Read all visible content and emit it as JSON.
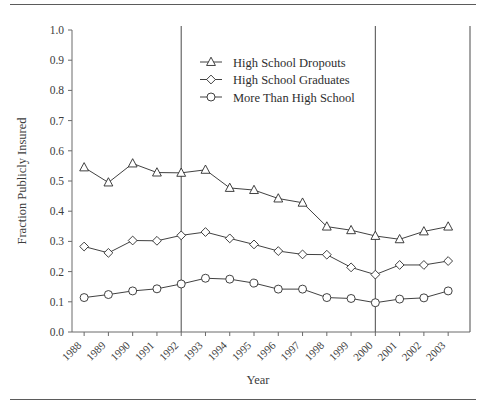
{
  "figure": {
    "has_top_rule": true,
    "has_bottom_rule": true,
    "background_color": "#ffffff",
    "ink_color": "#2b2b2b"
  },
  "chart_data": {
    "type": "line",
    "title": "",
    "xlabel": "Year",
    "ylabel": "Fraction Publicly Insured",
    "xlim": [
      1987.5,
      2003.9
    ],
    "ylim": [
      0.0,
      1.0
    ],
    "grid": false,
    "legend_position": "top-center",
    "categories": [
      "1988",
      "1989",
      "1990",
      "1991",
      "1992",
      "1993",
      "1994",
      "1995",
      "1996",
      "1997",
      "1998",
      "1999",
      "2000",
      "2001",
      "2002",
      "2003"
    ],
    "x": [
      1988,
      1989,
      1990,
      1991,
      1992,
      1993,
      1994,
      1995,
      1996,
      1997,
      1998,
      1999,
      2000,
      2001,
      2002,
      2003
    ],
    "ytick_labels": [
      "0.0",
      "0.1",
      "0.2",
      "0.3",
      "0.4",
      "0.5",
      "0.6",
      "0.7",
      "0.8",
      "0.9",
      "1.0"
    ],
    "ytick_values": [
      0.0,
      0.1,
      0.2,
      0.3,
      0.4,
      0.5,
      0.6,
      0.7,
      0.8,
      0.9,
      1.0
    ],
    "series": [
      {
        "name": "High  School Dropouts",
        "marker": "triangle",
        "values": [
          0.545,
          0.495,
          0.558,
          0.528,
          0.527,
          0.537,
          0.477,
          0.47,
          0.442,
          0.428,
          0.349,
          0.337,
          0.318,
          0.307,
          0.333,
          0.349
        ]
      },
      {
        "name": "High School Graduates",
        "marker": "diamond",
        "values": [
          0.283,
          0.262,
          0.303,
          0.302,
          0.32,
          0.331,
          0.31,
          0.29,
          0.268,
          0.257,
          0.256,
          0.214,
          0.19,
          0.222,
          0.222,
          0.235
        ]
      },
      {
        "name": "More Than High School",
        "marker": "circle",
        "values": [
          0.114,
          0.124,
          0.136,
          0.143,
          0.159,
          0.178,
          0.175,
          0.162,
          0.142,
          0.142,
          0.114,
          0.111,
          0.097,
          0.109,
          0.113,
          0.136
        ]
      }
    ],
    "annotations": [
      {
        "type": "vline",
        "x": 1992,
        "label": ""
      },
      {
        "type": "vline",
        "x": 2000,
        "label": ""
      },
      {
        "type": "vline",
        "x": 2003.9,
        "label": ""
      }
    ]
  }
}
